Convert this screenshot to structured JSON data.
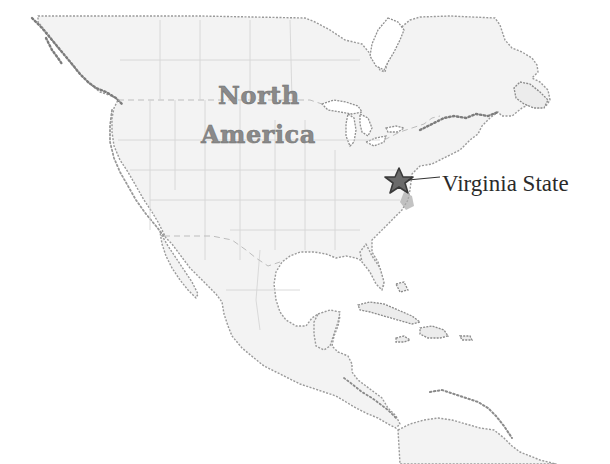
{
  "map": {
    "title_line1": "North",
    "title_line2": "America",
    "marker": {
      "label": "Virginia State",
      "icon": "star-icon",
      "color": "#6a6a6a",
      "outline_color": "#3a3a3a"
    },
    "colors": {
      "background": "#ffffff",
      "land": "#f3f3f3",
      "coastline": "#7c7c7c",
      "borders": "#d6d6d6",
      "label": "#2a2a2a",
      "continent_label": "#8a8a8a"
    }
  }
}
